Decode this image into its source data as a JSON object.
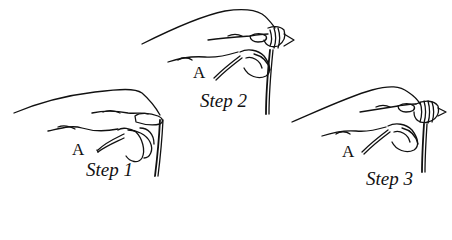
{
  "diagram": {
    "panels": [
      {
        "id": "step1",
        "point_label": "A",
        "step_label": "Step 1"
      },
      {
        "id": "step2",
        "point_label": "A",
        "step_label": "Step 2"
      },
      {
        "id": "step3",
        "point_label": "A",
        "step_label": "Step 3"
      }
    ],
    "colors": {
      "ink": "#111111",
      "background": "#ffffff"
    }
  }
}
